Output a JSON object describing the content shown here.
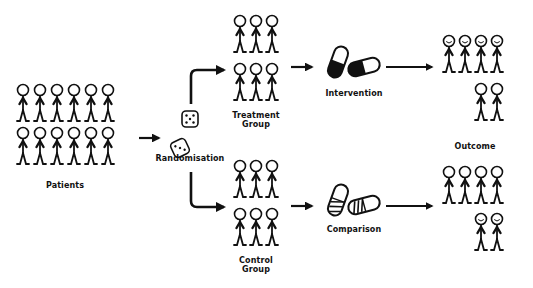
{
  "diagram": {
    "colors": {
      "ink": "#111111",
      "background": "#ffffff"
    },
    "nodes": {
      "patients": {
        "label": "Patients",
        "figure_count": 12,
        "layout": "6x2"
      },
      "randomisation": {
        "label": "Randomisation",
        "icon": "dice-icon"
      },
      "treatment_group": {
        "label_line1": "Treatment",
        "label_line2": "Group",
        "figure_count": 6,
        "layout": "3x2"
      },
      "control_group": {
        "label_line1": "Control",
        "label_line2": "Group",
        "figure_count": 6,
        "layout": "3x2"
      },
      "intervention": {
        "label": "Intervention",
        "icon": "solid-pill-icon"
      },
      "comparison": {
        "label": "Comparison",
        "icon": "striped-pill-icon"
      },
      "outcome": {
        "label": "Outcome"
      },
      "treatment_outcome": {
        "figure_count": 6,
        "smiling": 4,
        "neutral": 2
      },
      "control_outcome": {
        "figure_count": 6,
        "smiling": 2,
        "neutral": 4
      }
    },
    "edges": [
      {
        "from": "patients",
        "to": "randomisation"
      },
      {
        "from": "randomisation",
        "to": "treatment_group"
      },
      {
        "from": "randomisation",
        "to": "control_group"
      },
      {
        "from": "treatment_group",
        "to": "intervention"
      },
      {
        "from": "control_group",
        "to": "comparison"
      },
      {
        "from": "intervention",
        "to": "treatment_outcome"
      },
      {
        "from": "comparison",
        "to": "control_outcome"
      }
    ]
  }
}
